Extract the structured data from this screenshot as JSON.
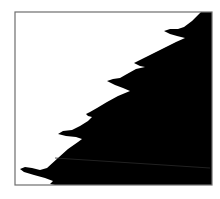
{
  "figure": {
    "colors": {
      "background": "#ffffff",
      "fill": "#000000",
      "frame": "#6e6e6e",
      "inner_line": "#2a2a2a"
    },
    "frame": {
      "x": 15,
      "y": 12,
      "width": 197,
      "height": 173
    },
    "hooks": [
      {
        "tip": [
          164,
          31
        ],
        "notch": [
          185,
          38
        ]
      },
      {
        "tip": [
          134,
          63
        ],
        "notch": [
          145,
          67
        ]
      },
      {
        "tip": [
          107,
          81
        ],
        "notch": [
          130,
          91
        ]
      },
      {
        "tip": [
          86,
          114
        ],
        "notch": [
          92,
          117
        ]
      },
      {
        "tip": [
          58,
          134
        ],
        "notch": [
          82,
          139
        ]
      },
      {
        "tip": [
          20,
          169
        ],
        "notch": [
          52,
          180
        ]
      }
    ],
    "region_points": "201,12 212,12 212,185 55,185 50,184 53,181 45,178 34,175 24,172 20,169 25,167 32,168 40,170 47,168 58,158 68,149 78,142 82,139 76,137 66,136 58,134 63,131 72,130 80,126 88,121 92,117 88,116 86,114 90,112 97,108 107,102 118,96 130,91 123,88 115,85 107,81 113,79 120,78 127,74 136,69 145,67 140,66 134,63 138,61 146,57 156,52 166,47 176,42 185,38 177,36 170,34 164,31 170,29 178,29 184,27 192,21",
    "inner_line": {
      "x1": 55,
      "y1": 158,
      "x2": 210,
      "y2": 168
    }
  }
}
